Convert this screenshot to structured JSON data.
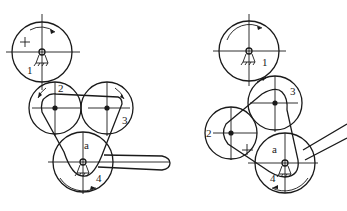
{
  "diagrams": [
    {
      "id": "left",
      "pulleys": [
        {
          "label": "1",
          "cx": 42,
          "cy": 52,
          "r": 30,
          "lx": 27,
          "ly": 74
        },
        {
          "label": "2",
          "cx": 55,
          "cy": 108,
          "r": 26,
          "lx": 58,
          "ly": 92
        },
        {
          "label": "3",
          "cx": 107,
          "cy": 108,
          "r": 26,
          "lx": 122,
          "ly": 124
        },
        {
          "label": "4",
          "cx": 83,
          "cy": 162,
          "r": 30,
          "lx": 96,
          "ly": 182
        }
      ],
      "center_label": {
        "text": "a",
        "x": 84,
        "y": 149
      }
    },
    {
      "id": "right",
      "pulleys": [
        {
          "label": "1",
          "cx": 249,
          "cy": 51,
          "r": 30,
          "lx": 262,
          "ly": 66
        },
        {
          "label": "2",
          "cx": 231,
          "cy": 133,
          "r": 26,
          "lx": 206,
          "ly": 137
        },
        {
          "label": "3",
          "cx": 275,
          "cy": 103,
          "r": 27,
          "lx": 290,
          "ly": 95
        },
        {
          "label": "4",
          "cx": 285,
          "cy": 163,
          "r": 30,
          "lx": 270,
          "ly": 182
        }
      ],
      "center_label": {
        "text": "a",
        "x": 272,
        "y": 153
      }
    }
  ]
}
